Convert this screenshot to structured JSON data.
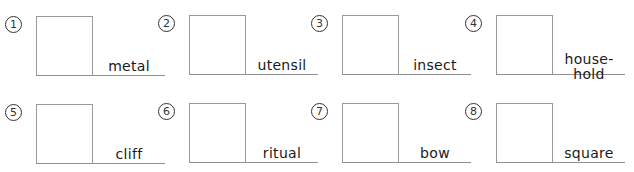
{
  "worksheet": {
    "items": [
      {
        "number": "1",
        "word": "metal"
      },
      {
        "number": "2",
        "word": "utensil"
      },
      {
        "number": "3",
        "word": "insect"
      },
      {
        "number": "4",
        "word": "house-\nhold"
      },
      {
        "number": "5",
        "word": "cliff"
      },
      {
        "number": "6",
        "word": "ritual"
      },
      {
        "number": "7",
        "word": "bow"
      },
      {
        "number": "8",
        "word": "square"
      }
    ],
    "colors": {
      "box_border": "#9a9a9a",
      "line": "#8f8f8f",
      "text": "#1a1a1a"
    }
  }
}
